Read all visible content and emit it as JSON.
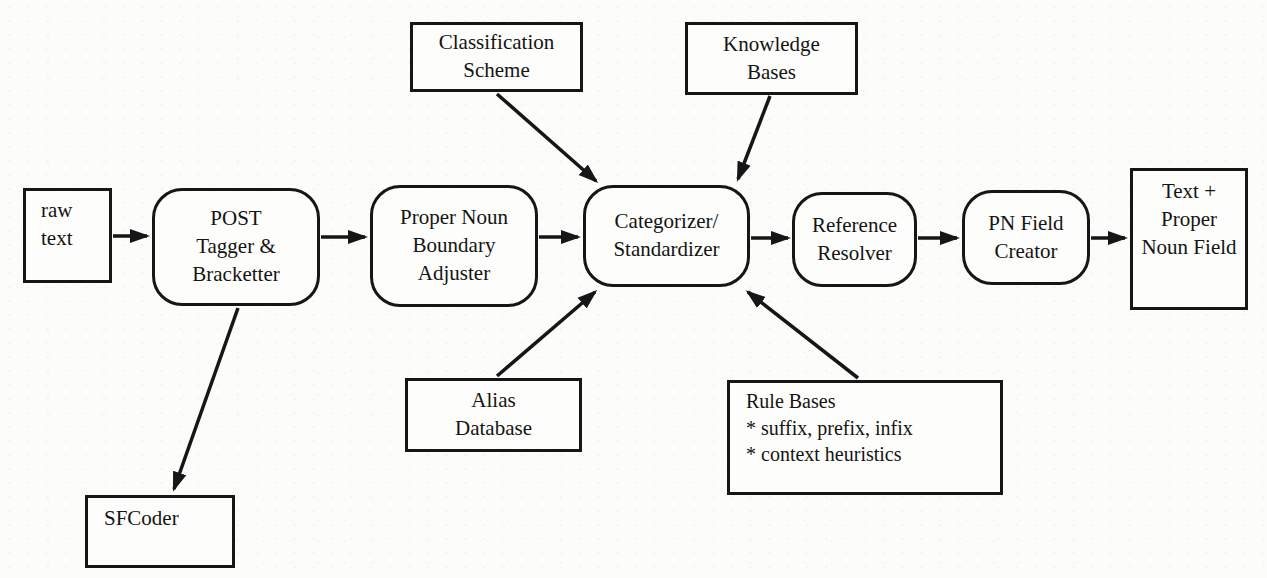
{
  "figure": {
    "background_color": "#fcfcfa",
    "line_color": "#161616",
    "nodes": {
      "raw_text": {
        "label": "raw\ntext",
        "shape": "rect"
      },
      "post_tagger": {
        "label": "POST\nTagger &\nBracketter",
        "shape": "rounded"
      },
      "pn_boundary_adjuster": {
        "label": "Proper Noun\nBoundary\nAdjuster",
        "shape": "rounded"
      },
      "categorizer": {
        "label": "Categorizer/\nStandardizer",
        "shape": "rounded"
      },
      "reference_resolver": {
        "label": "Reference\nResolver",
        "shape": "rounded"
      },
      "pn_field_creator": {
        "label": "PN Field\nCreator",
        "shape": "rounded"
      },
      "output_text": {
        "label": "Text +\nProper\nNoun Field",
        "shape": "rect"
      },
      "classification_scheme": {
        "label": "Classification\nScheme",
        "shape": "rect"
      },
      "knowledge_bases": {
        "label": "Knowledge\nBases",
        "shape": "rect"
      },
      "alias_database": {
        "label": "Alias\nDatabase",
        "shape": "rect"
      },
      "rule_bases": {
        "label": "Rule Bases\n*  suffix, prefix, infix\n*  context heuristics",
        "shape": "rect"
      },
      "sfcoder": {
        "label": "SFCoder",
        "shape": "rect"
      }
    },
    "edges": [
      {
        "from": "raw_text",
        "to": "post_tagger"
      },
      {
        "from": "post_tagger",
        "to": "pn_boundary_adjuster"
      },
      {
        "from": "pn_boundary_adjuster",
        "to": "categorizer"
      },
      {
        "from": "categorizer",
        "to": "reference_resolver"
      },
      {
        "from": "reference_resolver",
        "to": "pn_field_creator"
      },
      {
        "from": "pn_field_creator",
        "to": "output_text"
      },
      {
        "from": "classification_scheme",
        "to": "categorizer"
      },
      {
        "from": "knowledge_bases",
        "to": "categorizer"
      },
      {
        "from": "alias_database",
        "to": "categorizer"
      },
      {
        "from": "rule_bases",
        "to": "categorizer"
      },
      {
        "from": "post_tagger",
        "to": "sfcoder"
      }
    ]
  }
}
